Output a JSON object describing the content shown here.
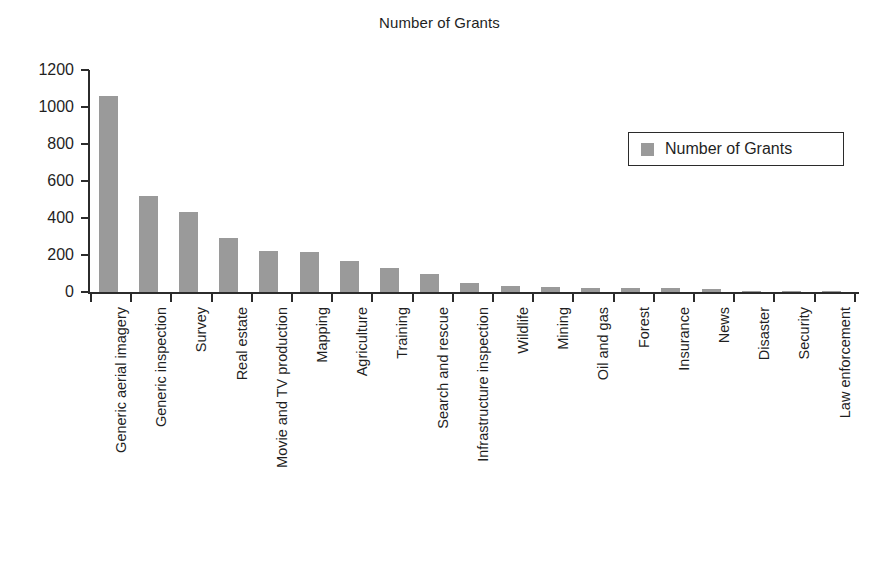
{
  "chart_data": {
    "type": "bar",
    "title": "Number of Grants",
    "xlabel": "",
    "ylabel": "",
    "ylim": [
      0,
      1200
    ],
    "yticks": [
      0,
      200,
      400,
      600,
      800,
      1000,
      1200
    ],
    "grid": false,
    "legend_position": "upper right",
    "bar_color": "#9a9a9a",
    "axis_color": "#2b2b2b",
    "text_color": "#1f1f1f",
    "categories": [
      "Generic aerial imagery",
      "Generic inspection",
      "Survey",
      "Real estate",
      "Movie and TV production",
      "Mapping",
      "Agriculture",
      "Training",
      "Search and rescue",
      "Infrastructure inspection",
      "Wildlife",
      "Mining",
      "Oil and gas",
      "Forest",
      "Insurance",
      "News",
      "Disaster",
      "Security",
      "Law enforcement"
    ],
    "series": [
      {
        "name": "Number of Grants",
        "values": [
          1060,
          520,
          435,
          290,
          222,
          218,
          170,
          128,
          100,
          50,
          32,
          26,
          24,
          24,
          24,
          18,
          8,
          4,
          3
        ]
      }
    ]
  },
  "legend": {
    "entries": [
      {
        "label": "Number of Grants",
        "color": "#9a9a9a"
      }
    ]
  }
}
